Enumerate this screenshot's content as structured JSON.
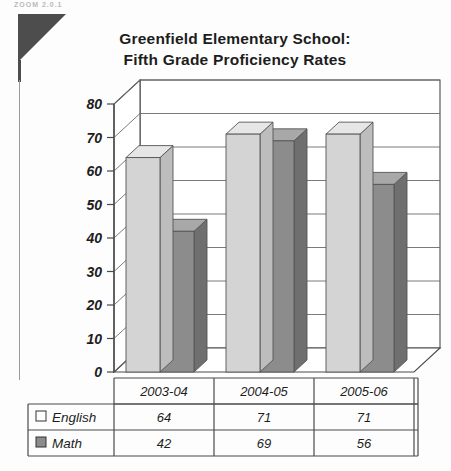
{
  "page": {
    "scan_header": "ZOOM 2.0.1"
  },
  "chart_data": {
    "type": "bar",
    "title": "Greenfield Elementary School: Fifth Grade Proficiency Rates",
    "title_line1": "Greenfield Elementary School:",
    "title_line2": "Fifth Grade Proficiency Rates",
    "xlabel": "",
    "ylabel": "",
    "ylim": [
      0,
      80
    ],
    "ytick_step": 10,
    "yticks": [
      "0",
      "10",
      "20",
      "30",
      "40",
      "50",
      "60",
      "70",
      "80"
    ],
    "categories": [
      "2003-04",
      "2004-05",
      "2005-06"
    ],
    "grid": true,
    "three_d": true,
    "legend_position": "table-left",
    "series": [
      {
        "name": "English",
        "values": [
          64,
          71,
          71
        ],
        "color": "#d4d4d4",
        "swatch": "hollow-square"
      },
      {
        "name": "Math",
        "values": [
          42,
          69,
          56
        ],
        "color": "#8c8c8c",
        "swatch": "filled-square"
      }
    ]
  },
  "data_table": {
    "column_headers": [
      "2003-04",
      "2004-05",
      "2005-06"
    ],
    "rows": [
      {
        "label": "English",
        "values": [
          "64",
          "71",
          "71"
        ]
      },
      {
        "label": "Math",
        "values": [
          "42",
          "69",
          "56"
        ]
      }
    ]
  },
  "colors": {
    "english_face": "#d4d4d4",
    "english_top": "#e6e6e6",
    "english_side": "#bdbdbd",
    "math_face": "#8c8c8c",
    "math_top": "#a8a8a8",
    "math_side": "#6f6f6f",
    "axis": "#4a4a4a",
    "grid": "#6b6b6b",
    "corner_mark": "#4d4d4d",
    "text": "#1d1d1d"
  }
}
